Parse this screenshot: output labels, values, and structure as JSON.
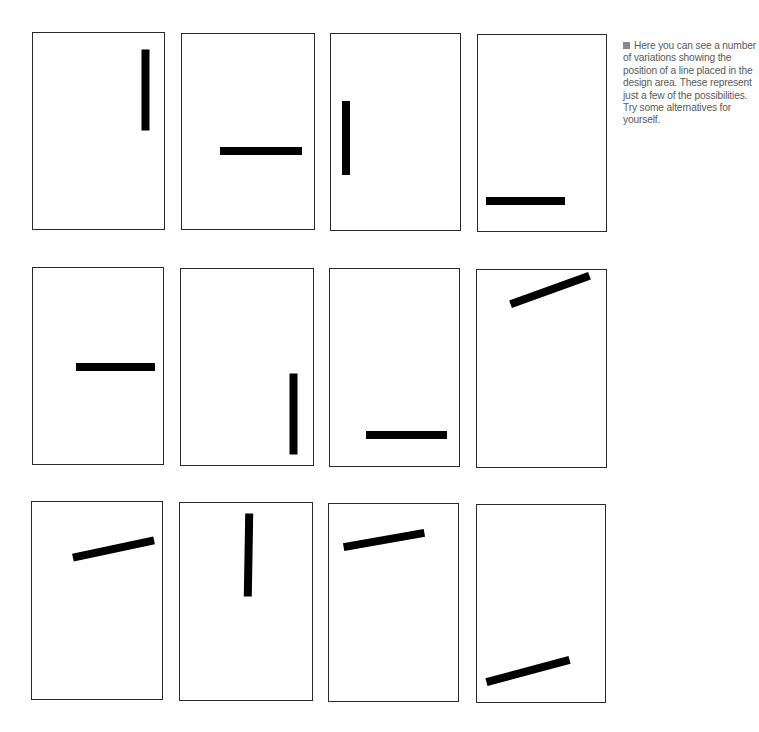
{
  "caption": {
    "bullet_icon": "square-bullet",
    "text": "Here you can see a number of variations showing the position of a line placed in the design area. These represent just a few of the possibilities. Try some alternatives for yourself.",
    "colors": {
      "text": "#5a5a5a",
      "bullet": "#8a8a8a"
    }
  },
  "grid": {
    "rows": 3,
    "columns": 4,
    "panel_border_color": "#2a2a2a",
    "line_color": "#000000"
  },
  "panels": [
    {
      "id": 1,
      "row": 1,
      "col": 1,
      "box": {
        "x": 32,
        "y": 32,
        "w": 133,
        "h": 198
      },
      "line": {
        "cx": 145,
        "cy": 90,
        "length": 81,
        "thickness": 8,
        "angle": 90
      }
    },
    {
      "id": 2,
      "row": 1,
      "col": 2,
      "box": {
        "x": 181,
        "y": 33,
        "w": 134,
        "h": 197
      },
      "line": {
        "cx": 261,
        "cy": 151,
        "length": 82,
        "thickness": 8,
        "angle": 0
      }
    },
    {
      "id": 3,
      "row": 1,
      "col": 3,
      "box": {
        "x": 330,
        "y": 33,
        "w": 131,
        "h": 198
      },
      "line": {
        "cx": 346,
        "cy": 138,
        "length": 74,
        "thickness": 8,
        "angle": 90
      }
    },
    {
      "id": 4,
      "row": 1,
      "col": 4,
      "box": {
        "x": 477,
        "y": 34,
        "w": 130,
        "h": 198
      },
      "line": {
        "cx": 525,
        "cy": 201,
        "length": 79,
        "thickness": 8,
        "angle": 0
      }
    },
    {
      "id": 5,
      "row": 2,
      "col": 1,
      "box": {
        "x": 32,
        "y": 267,
        "w": 132,
        "h": 198
      },
      "line": {
        "cx": 115,
        "cy": 367,
        "length": 79,
        "thickness": 8,
        "angle": 0
      }
    },
    {
      "id": 6,
      "row": 2,
      "col": 2,
      "box": {
        "x": 180,
        "y": 268,
        "w": 134,
        "h": 198
      },
      "line": {
        "cx": 293,
        "cy": 414,
        "length": 81,
        "thickness": 8,
        "angle": 90
      }
    },
    {
      "id": 7,
      "row": 2,
      "col": 3,
      "box": {
        "x": 329,
        "y": 268,
        "w": 131,
        "h": 199
      },
      "line": {
        "cx": 406,
        "cy": 435,
        "length": 81,
        "thickness": 8,
        "angle": 0
      }
    },
    {
      "id": 8,
      "row": 2,
      "col": 4,
      "box": {
        "x": 476,
        "y": 269,
        "w": 131,
        "h": 199
      },
      "line": {
        "cx": 550,
        "cy": 290,
        "length": 84,
        "thickness": 8,
        "angle": -20
      }
    },
    {
      "id": 9,
      "row": 3,
      "col": 1,
      "box": {
        "x": 31,
        "y": 501,
        "w": 132,
        "h": 199
      },
      "line": {
        "cx": 113,
        "cy": 549,
        "length": 83,
        "thickness": 8,
        "angle": -12
      }
    },
    {
      "id": 10,
      "row": 3,
      "col": 2,
      "box": {
        "x": 179,
        "y": 502,
        "w": 134,
        "h": 199
      },
      "line": {
        "cx": 248,
        "cy": 555,
        "length": 83,
        "thickness": 8,
        "angle": 91
      }
    },
    {
      "id": 11,
      "row": 3,
      "col": 3,
      "box": {
        "x": 328,
        "y": 503,
        "w": 131,
        "h": 199
      },
      "line": {
        "cx": 384,
        "cy": 540,
        "length": 82,
        "thickness": 8,
        "angle": -10
      }
    },
    {
      "id": 12,
      "row": 3,
      "col": 4,
      "box": {
        "x": 476,
        "y": 504,
        "w": 130,
        "h": 199
      },
      "line": {
        "cx": 528,
        "cy": 671,
        "length": 86,
        "thickness": 8,
        "angle": -15
      }
    }
  ]
}
